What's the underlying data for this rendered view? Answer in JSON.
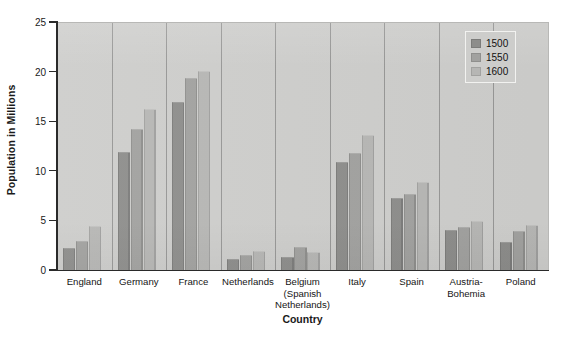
{
  "chart_data": {
    "type": "bar",
    "title": "",
    "xlabel": "Country",
    "ylabel": "Population in Millions",
    "ylim": [
      0,
      25
    ],
    "yticks": [
      0,
      5,
      10,
      15,
      20,
      25
    ],
    "ytick_labels": [
      "0",
      "5",
      "10",
      "15",
      "20",
      "25"
    ],
    "grid": false,
    "legend_position": "top-right",
    "categories": [
      "England",
      "Germany",
      "France",
      "Netherlands",
      "Belgium\n(Spanish\nNetherlands)",
      "Italy",
      "Spain",
      "Austria-\nBohemia",
      "Poland"
    ],
    "series": [
      {
        "name": "1500",
        "color": "#8d8d8b",
        "values": [
          2.3,
          12.0,
          17.0,
          1.2,
          1.4,
          11.0,
          7.4,
          4.1,
          2.9
        ]
      },
      {
        "name": "1550",
        "color": "#a1a19f",
        "values": [
          3.0,
          14.3,
          19.5,
          1.6,
          2.4,
          11.9,
          7.8,
          4.4,
          4.0
        ]
      },
      {
        "name": "1600",
        "color": "#b6b6b4",
        "values": [
          4.5,
          16.3,
          20.2,
          2.0,
          1.9,
          13.7,
          9.0,
          5.0,
          4.6
        ]
      }
    ]
  },
  "legend": {
    "items": [
      {
        "label": "1500"
      },
      {
        "label": "1550"
      },
      {
        "label": "1600"
      }
    ]
  },
  "colors": {
    "plot_background": "#cdcdcb",
    "axis": "#2a2a2a",
    "series_1500": "#8d8d8b",
    "series_1550": "#a1a19f",
    "series_1600": "#b6b6b4"
  }
}
